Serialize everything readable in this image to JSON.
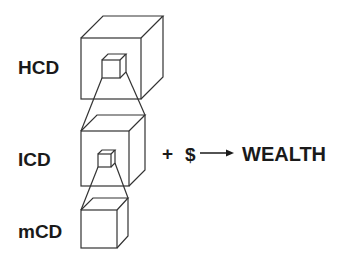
{
  "labels": {
    "hcd": "HCD",
    "icd": "ICD",
    "mcd": "mCD"
  },
  "equation": {
    "plus": "+",
    "money": "$",
    "result": "WEALTH"
  },
  "colors": {
    "line": "#333333",
    "text": "#1a1a1a",
    "background": "#ffffff"
  }
}
